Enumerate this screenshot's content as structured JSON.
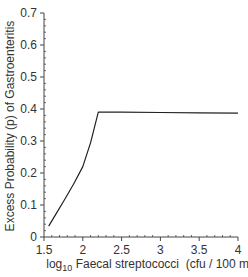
{
  "chart_data": {
    "type": "line",
    "title": "",
    "xlabel": "log10 Faecal streptococci (cfu / 100 ml)",
    "xlabel_parts": {
      "prefix": "log",
      "subscript": "10",
      "rest": " Faecal streptococci  (cfu / 100 ml)"
    },
    "ylabel": "Excess Probability (p) of Gastroenteritis",
    "xlim": [
      1.5,
      4
    ],
    "ylim": [
      0,
      0.7
    ],
    "xticks": [
      1.5,
      2,
      2.5,
      3,
      3.5,
      4
    ],
    "xtick_labels": [
      "1.5",
      "2",
      "2.5",
      "3",
      "3.5",
      "4"
    ],
    "yticks": [
      0,
      0.1,
      0.2,
      0.3,
      0.4,
      0.5,
      0.6,
      0.7
    ],
    "ytick_labels": [
      "0",
      "0.1",
      "0.2",
      "0.3",
      "0.4",
      "0.5",
      "0.6",
      "0.7"
    ],
    "grid": false,
    "legend": null,
    "series": [
      {
        "name": "Excess probability",
        "color": "#222222",
        "x": [
          1.56,
          1.65,
          1.76,
          1.88,
          2.0,
          2.1,
          2.2,
          2.5,
          3.0,
          3.5,
          4.0
        ],
        "y": [
          0.034,
          0.07,
          0.115,
          0.165,
          0.22,
          0.295,
          0.39,
          0.39,
          0.389,
          0.388,
          0.387
        ]
      }
    ]
  }
}
